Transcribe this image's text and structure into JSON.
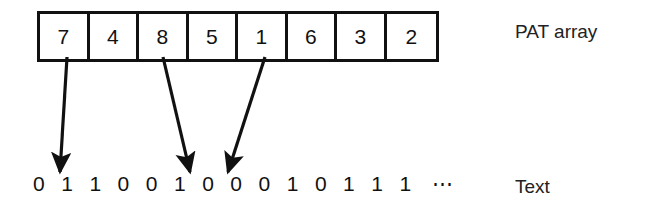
{
  "figure": {
    "title_labels": {
      "pat_array": "PAT array",
      "text": "Text"
    },
    "pat_array": {
      "name": "PAT array",
      "cells": [
        "7",
        "4",
        "8",
        "5",
        "1",
        "6",
        "3",
        "2"
      ]
    },
    "text": {
      "name": "Text",
      "bits": [
        "0",
        "1",
        "1",
        "0",
        "0",
        "1",
        "0",
        "0",
        "0",
        "1",
        "0",
        "1",
        "1",
        "1"
      ],
      "continuation": "⋯"
    },
    "arrows": [
      {
        "from_label": "7",
        "from": [
          67,
          57
        ],
        "to": [
          58,
          175
        ]
      },
      {
        "from_label": "8",
        "from": [
          163,
          57
        ],
        "to": [
          192,
          176
        ]
      },
      {
        "from_label": "1",
        "from": [
          265,
          57
        ],
        "to": [
          226,
          176
        ]
      }
    ],
    "colors": {
      "ink": "#111111",
      "background": "#ffffff"
    }
  }
}
